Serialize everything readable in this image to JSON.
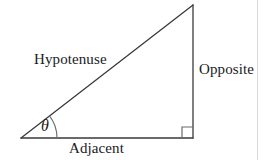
{
  "figure": {
    "background_color": "#ffffff",
    "stroke_color": "#3a3a3a",
    "text_color": "#1a1a1a",
    "labels": {
      "hypotenuse": "Hypotenuse",
      "opposite": "Opposite",
      "adjacent": "Adjacent",
      "angle": "θ"
    },
    "geometry": {
      "left_vertex": [
        21,
        138
      ],
      "top_vertex": [
        193,
        5
      ],
      "right_angle_vertex": [
        193,
        138
      ],
      "angle_arc_radius": 30,
      "right_angle_marker_size": 11
    },
    "page_edge_color": "#d9d9d9"
  }
}
